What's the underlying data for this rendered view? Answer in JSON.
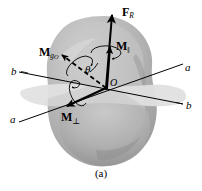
{
  "figure": {
    "caption": "(a)",
    "background_color": "#ffffff",
    "stroke_color": "#000000",
    "body_fill": "#b9b9b9",
    "body_fill_light": "#cfcfcf",
    "body_fill_dark": "#9a9a9a",
    "plane_fill": "#d8d8d8"
  },
  "labels": {
    "resultant_force": {
      "symbol": "F",
      "subscript": "R",
      "name": "F_R"
    },
    "moment_parallel": {
      "symbol": "M",
      "subscript": "‖",
      "name": "M_parallel"
    },
    "moment_gO": {
      "symbol": "M",
      "subscript": "g",
      "subscript2": "O",
      "name": "M_gO"
    },
    "moment_perpendicular": {
      "symbol": "M",
      "subscript": "⊥",
      "name": "M_perpendicular"
    },
    "angle": "θ",
    "origin": "O",
    "axis_a_right": "a",
    "axis_a_left": "a",
    "axis_b_right": "b",
    "axis_b_left": "b"
  },
  "geometry": {
    "origin_point": {
      "x": 106,
      "y": 88
    },
    "axis_a": {
      "x1": 18,
      "y1": 122,
      "x2": 184,
      "y2": 64
    },
    "axis_b": {
      "x1": 18,
      "y1": 72,
      "x2": 184,
      "y2": 104
    },
    "vector_FR": {
      "x1": 106,
      "y1": 88,
      "x2": 112,
      "y2": 14
    },
    "vector_Mpar": {
      "x1": 106,
      "y1": 88,
      "x2": 110,
      "y2": 46
    },
    "vector_MgO": {
      "x1": 106,
      "y1": 88,
      "x2": 61,
      "y2": 54,
      "style": "dashed"
    },
    "vector_Mperp": {
      "x1": 106,
      "y1": 88,
      "x2": 66,
      "y2": 107
    }
  }
}
